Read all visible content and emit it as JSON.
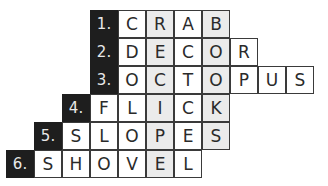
{
  "puzzle": {
    "rows": [
      {
        "number": "1.",
        "numCol": 3,
        "word": "CRAB"
      },
      {
        "number": "2.",
        "numCol": 3,
        "word": "DECOR"
      },
      {
        "number": "3.",
        "numCol": 3,
        "word": "OCTOPUS"
      },
      {
        "number": "4.",
        "numCol": 2,
        "word": "FLICK"
      },
      {
        "number": "5.",
        "numCol": 1,
        "word": "SLOPES"
      },
      {
        "number": "6.",
        "numCol": 0,
        "word": "SHOVEL"
      }
    ],
    "shadedColumns": [
      5,
      7
    ],
    "colors": {
      "numberCell": "#1e1e1e",
      "shadedCell": "#ebebeb",
      "border": "#3a3a3a"
    }
  }
}
